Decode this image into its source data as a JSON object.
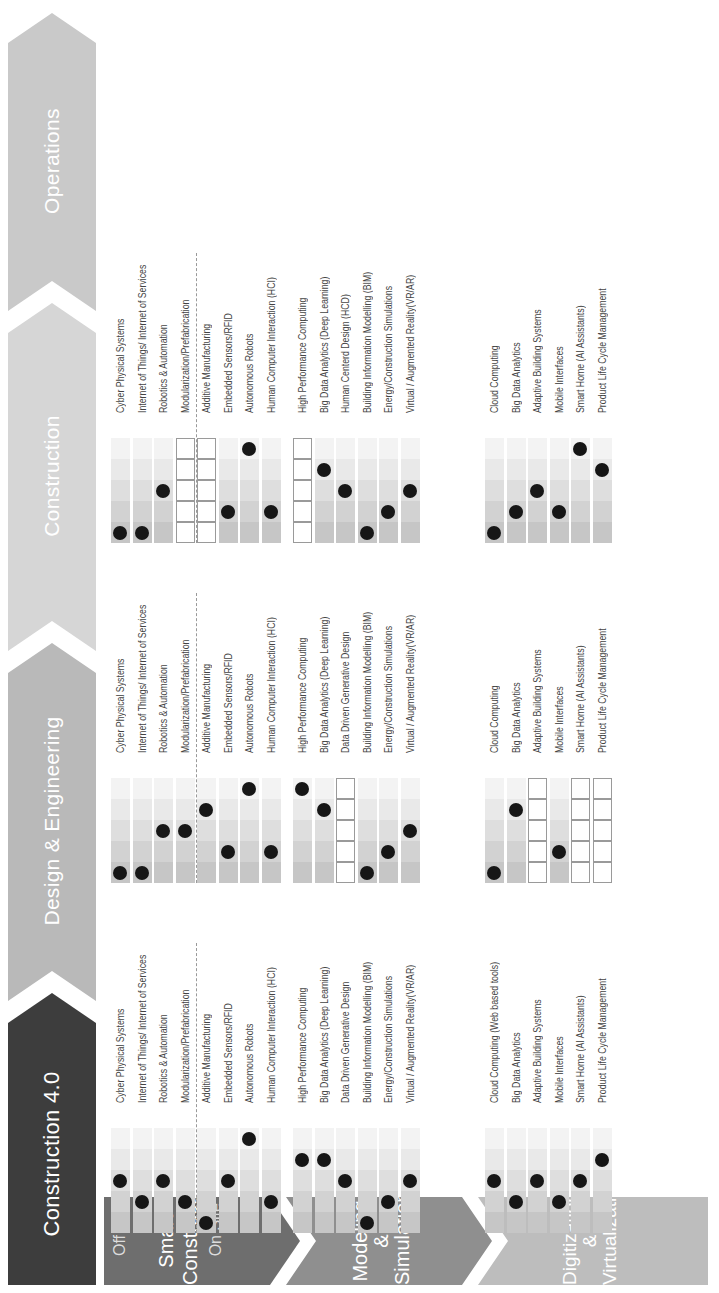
{
  "title": "Construction 4.0",
  "phases": [
    {
      "label": "Design & Engineering",
      "color": "#b9b9b9"
    },
    {
      "label": "Construction",
      "color": "#d6d6d6"
    },
    {
      "label": "Operations",
      "color": "#c9c9c9"
    }
  ],
  "categories": [
    {
      "label_line1": "Smart",
      "label_line2": "Construction",
      "sub_top": "Off Site",
      "sub_bottom": "On Site",
      "color": "#6e6e6e"
    },
    {
      "label_line1": "Modeling",
      "label_line2": "& Simulation",
      "color": "#8f8f8f"
    },
    {
      "label_line1": "Digitization",
      "label_line2": "& Virtualization",
      "color": "#bdbdbd"
    }
  ],
  "legend": {
    "levels": 5,
    "empty_box_meaning": "not applicable",
    "segment_colors": [
      "#c6c6c6",
      "#d2d2d2",
      "#dedede",
      "#e9e9e9",
      "#f3f3f3"
    ]
  },
  "chart_data": {
    "type": "table",
    "title": "Construction 4.0",
    "phases": [
      "Design & Engineering",
      "Construction",
      "Operations"
    ],
    "groups": [
      {
        "name": "Smart Construction",
        "rows": [
          {
            "design": "Cyber Physical Systems",
            "construction": "Cyber Physical Systems",
            "operations": "Cyber Physical Systems",
            "levels": [
              3,
              1,
              1
            ]
          },
          {
            "design": "Internet of Things/ Internet of Services",
            "construction": "Internet of Things/ Internet of Services",
            "operations": "Internet of Things/ Internet of Services",
            "levels": [
              2,
              1,
              1
            ]
          },
          {
            "design": "Robotics & Automation",
            "construction": "Robotics & Automation",
            "operations": "Robotics & Automation",
            "levels": [
              3,
              3,
              3
            ]
          },
          {
            "design": "Modularization/Prefabrication",
            "construction": "Modularization/Prefabrication",
            "operations": "Modularization/Prefabrication",
            "levels": [
              2,
              3,
              null
            ]
          },
          {
            "design": "Additive Manufacturing",
            "construction": "Additive Manufacturing",
            "operations": "Additive Manufacturing",
            "levels": [
              1,
              4,
              null
            ]
          },
          {
            "design": "Embedded Sensors/RFID",
            "construction": "Embedded Sensors/RFID",
            "operations": "Embedded Sensors/RFID",
            "levels": [
              3,
              2,
              2
            ]
          },
          {
            "design": "Autonomous Robots",
            "construction": "Autonomous Robots",
            "operations": "Autonomous Robots",
            "levels": [
              5,
              5,
              5
            ]
          },
          {
            "design": "Human Computer Interaction (HCI)",
            "construction": "Human Computer Interaction (HCI)",
            "operations": "Human Computer Interaction (HCI)",
            "levels": [
              2,
              2,
              2
            ]
          }
        ]
      },
      {
        "name": "Modeling & Simulation",
        "rows": [
          {
            "design": "High Performance Computing",
            "construction": "High Performance Computing",
            "operations": "High Performance Computing",
            "levels": [
              4,
              5,
              null
            ]
          },
          {
            "design": "Big Data Analytics (Deep Learning)",
            "construction": "Big Data Analytics (Deep Learning)",
            "operations": "Big Data Analytics (Deep Learning)",
            "levels": [
              4,
              4,
              4
            ]
          },
          {
            "design": "Data Driven Generative Design",
            "construction": "Data Driven Generative Design",
            "operations": "Human Centerd Design (HCD)",
            "levels": [
              3,
              null,
              3
            ]
          },
          {
            "design": "Building Information Modelling (BIM)",
            "construction": "Building Information Modelling (BIM)",
            "operations": "Building Information Modelling (BIM)",
            "levels": [
              1,
              1,
              1
            ]
          },
          {
            "design": "Energy/Construction Simulations",
            "construction": "Energy/Construction Simulations",
            "operations": "Energy/Construction Simulations",
            "levels": [
              2,
              2,
              2
            ]
          },
          {
            "design": "Virtual / Augmented Reality(VR/AR)",
            "construction": "Virtual / Augmented Reality(VR/AR)",
            "operations": "Virtual / Augmented Reality(VR/AR)",
            "levels": [
              3,
              3,
              3
            ]
          }
        ]
      },
      {
        "name": "Digitization & Virtualization",
        "rows": [
          {
            "design": "Cloud Computing (Web based tools)",
            "construction": "Cloud Computing",
            "operations": "Cloud Computing",
            "levels": [
              3,
              1,
              1
            ]
          },
          {
            "design": "Big Data Analytics",
            "construction": "Big Data Analytics",
            "operations": "Big Data Analytics",
            "levels": [
              2,
              4,
              2
            ]
          },
          {
            "design": "Adaptive Building Systems",
            "construction": "Adaptive Building Systems",
            "operations": "Adaptive Building Systems",
            "levels": [
              3,
              null,
              3
            ]
          },
          {
            "design": "Mobile Interfaces",
            "construction": "Mobile Interfaces",
            "operations": "Mobile Interfaces",
            "levels": [
              2,
              2,
              2
            ]
          },
          {
            "design": "Smart Home (AI Assistants)",
            "construction": "Smart Home (AI Assistants)",
            "operations": "Smart Home (AI Assistants)",
            "levels": [
              3,
              null,
              5
            ]
          },
          {
            "design": "Product Life Cycle Management",
            "construction": "Product Life Cycle Management",
            "operations": "Product Life Cycle Management",
            "levels": [
              4,
              null,
              4
            ]
          }
        ]
      }
    ]
  }
}
